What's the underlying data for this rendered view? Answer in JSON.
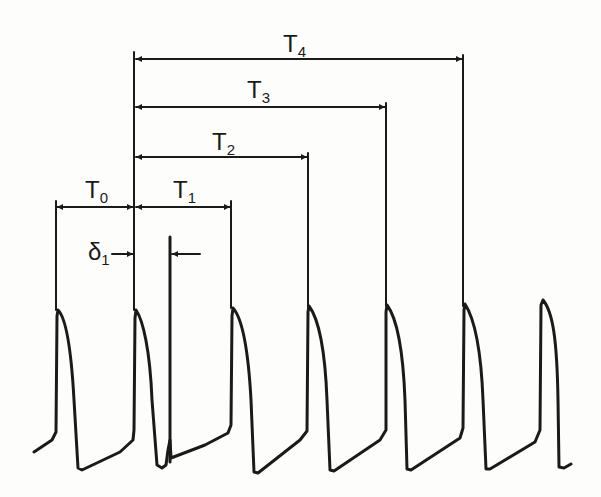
{
  "figure": {
    "intervals": [
      {
        "id": "T0",
        "base": "T",
        "sub": "0"
      },
      {
        "id": "T1",
        "base": "T",
        "sub": "1"
      },
      {
        "id": "T2",
        "base": "T",
        "sub": "2"
      },
      {
        "id": "T3",
        "base": "T",
        "sub": "3"
      },
      {
        "id": "T4",
        "base": "T",
        "sub": "4"
      }
    ],
    "delay": {
      "id": "delta1",
      "base": "δ",
      "sub": "1"
    },
    "colors": {
      "ink": "#1a1a1a",
      "background": "#fdfdfb"
    },
    "action_potential_count": 7,
    "stimulus_marker_count": 1
  }
}
